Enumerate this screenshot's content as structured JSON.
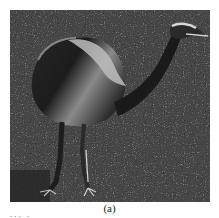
{
  "figure": {
    "caption": "(a)",
    "cropped_text_fragment": "... .",
    "colors": {
      "grass_dark": "#3a3a3a",
      "grass_mid": "#5c5c5c",
      "body_dark": "#1e1e1e",
      "feather_light": "#c8c8c8",
      "background": "#ffffff"
    }
  }
}
